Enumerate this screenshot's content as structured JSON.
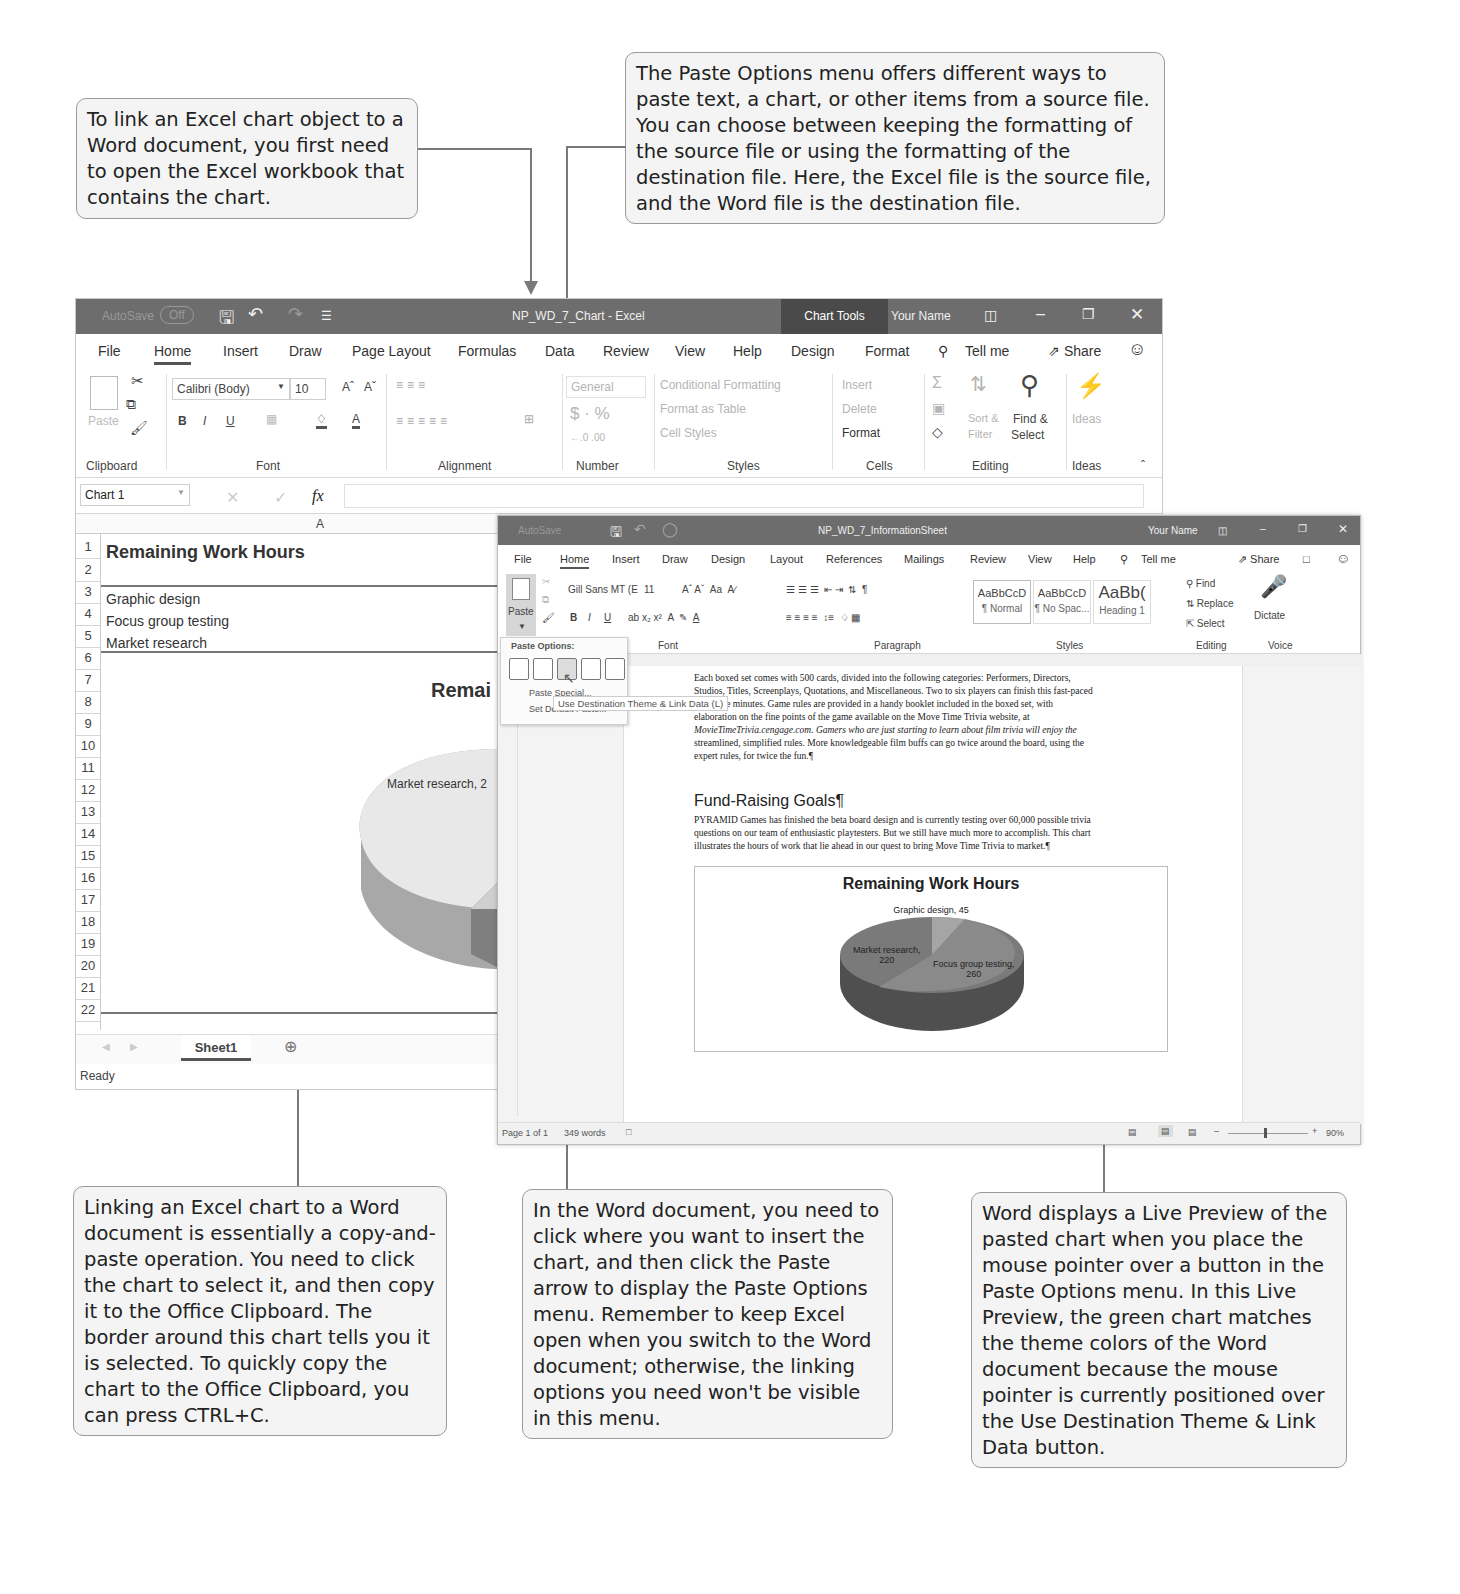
{
  "callouts": {
    "top_left": "To link an Excel chart object to a Word document, you first need to open the Excel workbook that contains the chart.",
    "top_right": "The Paste Options menu offers different ways to paste text, a chart, or other items from a source file. You can choose between keeping the formatting of the source file or using the formatting of the destination file. Here, the Excel file is the source file, and the Word file is the destination file.",
    "bottom_left": "Linking an Excel chart to a Word document is essentially a copy-and-paste operation. You need to click the chart to select it, and then copy it to the Office Clipboard. The border around this chart tells you it is selected. To quickly copy the chart to the Office Clipboard, you can press CTRL+C.",
    "bottom_middle": "In the Word document, you need to click where you want to insert the chart, and then click the Paste arrow to display the Paste Options menu. Remember to keep Excel open when you switch to the Word document; otherwise, the linking options you need won't be visible in this menu.",
    "bottom_right": "Word displays a Live Preview of the pasted chart when you place the mouse pointer over a button in the Paste Options menu. In this Live Preview, the green chart matches the theme colors of the Word document because the mouse pointer is currently positioned over the Use Destination Theme & Link Data button."
  },
  "excel": {
    "autosave_label": "AutoSave",
    "autosave_state": "Off",
    "title": "NP_WD_7_Chart - Excel",
    "chart_tools": "Chart Tools",
    "user": "Your Name",
    "tabs": [
      "File",
      "Home",
      "Insert",
      "Draw",
      "Page Layout",
      "Formulas",
      "Data",
      "Review",
      "View",
      "Help",
      "Design",
      "Format"
    ],
    "tell_me": "Tell me",
    "share": "Share",
    "ribbon": {
      "paste": "Paste",
      "font_name": "Calibri (Body)",
      "font_size": "10",
      "number_format": "General",
      "conditional_formatting": "Conditional Formatting",
      "format_as_table": "Format as Table",
      "cell_styles": "Cell Styles",
      "insert": "Insert",
      "delete": "Delete",
      "format": "Format",
      "sort_filter_1": "Sort &",
      "sort_filter_2": "Filter",
      "find_select_1": "Find &",
      "find_select_2": "Select",
      "ideas": "Ideas",
      "groups": [
        "Clipboard",
        "Font",
        "Alignment",
        "Number",
        "Styles",
        "Cells",
        "Editing",
        "Ideas"
      ]
    },
    "name_box": "Chart 1",
    "fx": "fx",
    "column_header": "A",
    "rows": [
      {
        "n": "1",
        "text": "Remaining Work Hours"
      },
      {
        "n": "2",
        "text": ""
      },
      {
        "n": "3",
        "text": "Graphic design"
      },
      {
        "n": "4",
        "text": "Focus group testing"
      },
      {
        "n": "5",
        "text": "Market research"
      },
      {
        "n": "6",
        "text": ""
      },
      {
        "n": "7",
        "text": ""
      },
      {
        "n": "8",
        "text": ""
      },
      {
        "n": "9",
        "text": ""
      },
      {
        "n": "10",
        "text": ""
      },
      {
        "n": "11",
        "text": ""
      },
      {
        "n": "12",
        "text": ""
      },
      {
        "n": "13",
        "text": ""
      },
      {
        "n": "14",
        "text": ""
      },
      {
        "n": "15",
        "text": ""
      },
      {
        "n": "16",
        "text": ""
      },
      {
        "n": "17",
        "text": ""
      },
      {
        "n": "18",
        "text": ""
      },
      {
        "n": "19",
        "text": ""
      },
      {
        "n": "20",
        "text": ""
      },
      {
        "n": "21",
        "text": ""
      },
      {
        "n": "22",
        "text": ""
      }
    ],
    "chart_title_partial": "Remai",
    "chart_label_partial": "Market research, 2",
    "sheet_tab": "Sheet1",
    "status": "Ready"
  },
  "word": {
    "title": "NP_WD_7_InformationSheet",
    "user": "Your Name",
    "tabs": [
      "File",
      "Home",
      "Insert",
      "Draw",
      "Design",
      "Layout",
      "References",
      "Mailings",
      "Review",
      "View",
      "Help"
    ],
    "tell_me": "Tell me",
    "share": "Share",
    "ribbon": {
      "paste": "Paste",
      "font_name": "Gill Sans MT (E",
      "font_size": "11",
      "styles": [
        {
          "preview": "AaBbCcD",
          "name": "¶ Normal"
        },
        {
          "preview": "AaBbCcD",
          "name": "¶ No Spac..."
        },
        {
          "preview": "AaBb(",
          "name": "Heading 1"
        }
      ],
      "find": "Find",
      "replace": "Replace",
      "select": "Select",
      "dictate": "Dictate",
      "groups": [
        "Font",
        "Paragraph",
        "Styles",
        "Editing",
        "Voice"
      ]
    },
    "paste_menu": {
      "header": "Paste Options:",
      "icons": [
        "keep-source-formatting-icon",
        "use-destination-theme-icon",
        "use-destination-theme-link-data-icon",
        "keep-source-link-icon",
        "picture-icon"
      ],
      "paste_special": "Paste Special...",
      "set_default": "Set Default Paste...",
      "tooltip": "Use Destination Theme & Link Data (L)"
    },
    "doc": {
      "para1_lines": [
        "Each boxed set comes with 500 cards, divided into the following categories: Performers, Directors,",
        "Studios, Titles, Screenplays, Quotations, and Miscellaneous. Two to six players can finish this fast-paced",
        "forty-five minutes. Game rules are provided in a handy booklet included in the boxed set, with",
        "elaboration on the fine points of the game available on the Move Time Trivia website, at",
        "MovieTimeTrivia.cengage.com. Gamers who are just starting to learn about film trivia will enjoy the",
        "streamlined, simplified rules. More knowledgeable film buffs can go twice around the board, using the",
        "expert rules, for twice the fun.¶"
      ],
      "heading": "Fund-Raising Goals¶",
      "para2_lines": [
        "PYRAMID Games has finished the beta board design and is currently testing over 60,000 possible trivia",
        "questions on our team of enthusiastic playtesters. But we still have much more to accomplish. This chart",
        "illustrates the hours of work that lie ahead in our quest to bring Move Time Trivia to market.¶"
      ],
      "chart_title": "Remaining Work Hours",
      "label_graphic": "Graphic design, 45",
      "label_market_1": "Market research,",
      "label_market_2": "220",
      "label_focus_1": "Focus group testing,",
      "label_focus_2": "260"
    },
    "status": {
      "page": "Page 1 of 1",
      "words": "349 words",
      "zoom": "90%"
    }
  },
  "chart_data": {
    "type": "pie",
    "title": "Remaining Work Hours",
    "categories": [
      "Graphic design",
      "Focus group testing",
      "Market research"
    ],
    "values": [
      45,
      260,
      220
    ],
    "xlabel": "",
    "ylabel": ""
  }
}
